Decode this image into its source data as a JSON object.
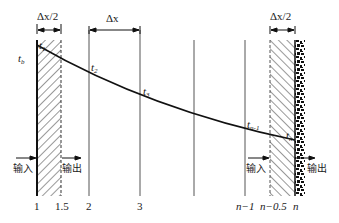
{
  "dimensions": {
    "half_cell_left": "Δx/2",
    "cell": "Δx",
    "half_cell_right": "Δx/2"
  },
  "temperatures": {
    "boundary": {
      "base": "t",
      "sub": "b"
    },
    "t1": {
      "base": "t",
      "sub": "1"
    },
    "t2": {
      "base": "t",
      "sub": "2"
    },
    "t3": {
      "base": "t",
      "sub": "3"
    },
    "tn_1": {
      "base": "t",
      "sub": "n-1"
    },
    "tn": {
      "base": "t",
      "sub": "n"
    }
  },
  "flows": {
    "left_in": "输入",
    "left_out": "输出",
    "right_in": "输入",
    "right_out": "输出"
  },
  "node_labels": [
    "1",
    "1.5",
    "2",
    "3",
    "n−1",
    "n−0.5",
    "n"
  ]
}
